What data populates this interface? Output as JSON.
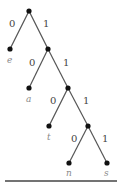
{
  "diagram": {
    "type": "binary-trie",
    "nodes": [
      {
        "id": "root",
        "x": 29,
        "y": 11
      },
      {
        "id": "n1",
        "x": 48,
        "y": 49
      },
      {
        "id": "n2",
        "x": 68,
        "y": 88
      },
      {
        "id": "n3",
        "x": 88,
        "y": 126
      },
      {
        "id": "e",
        "x": 10,
        "y": 49,
        "leaf": "e"
      },
      {
        "id": "a",
        "x": 29,
        "y": 88,
        "leaf": "a"
      },
      {
        "id": "t",
        "x": 49,
        "y": 126,
        "leaf": "t"
      },
      {
        "id": "n",
        "x": 69,
        "y": 163,
        "leaf": "n"
      },
      {
        "id": "s",
        "x": 107,
        "y": 163,
        "leaf": "s"
      }
    ],
    "edges": [
      {
        "from": "root",
        "to": "e",
        "label": "0"
      },
      {
        "from": "root",
        "to": "n1",
        "label": "1"
      },
      {
        "from": "n1",
        "to": "a",
        "label": "0"
      },
      {
        "from": "n1",
        "to": "n2",
        "label": "1"
      },
      {
        "from": "n2",
        "to": "t",
        "label": "0"
      },
      {
        "from": "n2",
        "to": "n3",
        "label": "1"
      },
      {
        "from": "n3",
        "to": "n",
        "label": "0"
      },
      {
        "from": "n3",
        "to": "s",
        "label": "1"
      }
    ],
    "leaf_labels": [
      "e",
      "a",
      "t",
      "n",
      "s"
    ],
    "edge_labels": [
      "0",
      "1"
    ]
  }
}
